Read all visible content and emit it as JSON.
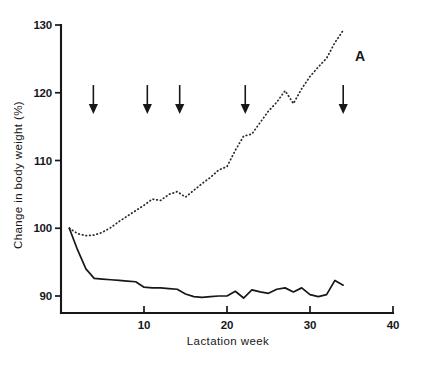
{
  "figure": {
    "panel_label": "A",
    "background_color": "#ffffff",
    "ink_color": "#17171a"
  },
  "chart_data": {
    "type": "line",
    "title": "",
    "subtitle": "",
    "xlabel": "Lactation week",
    "ylabel": "Change in body weight (%)",
    "xlim": [
      0,
      40
    ],
    "ylim": [
      86,
      130
    ],
    "xticks": [
      10,
      20,
      30,
      40
    ],
    "xtick_labels": [
      "10",
      "20",
      "30",
      "40"
    ],
    "yticks": [
      90,
      100,
      110,
      120,
      130
    ],
    "ytick_labels": [
      "90",
      "100",
      "110",
      "120",
      "130"
    ],
    "grid": false,
    "legend": false,
    "legend_position": "none",
    "annotations": [
      {
        "text": "A",
        "x": 36.8,
        "y": 125.0,
        "role": "panel-label"
      }
    ],
    "markers": {
      "type": "down-arrow",
      "label": "treatment-marker",
      "y": 117.0,
      "x_values": [
        3.9,
        10.4,
        14.3,
        22.2,
        34.0
      ]
    },
    "series": [
      {
        "name": "dotted",
        "style": "dotted",
        "color": "#2a2a2e",
        "x": [
          1,
          2,
          3,
          4,
          5,
          6,
          7,
          8,
          9,
          10,
          11,
          12,
          13,
          14,
          15,
          16,
          17,
          18,
          19,
          20,
          21,
          22,
          23,
          24,
          25,
          26,
          27,
          28,
          29,
          30,
          31,
          32,
          33,
          34
        ],
        "values": [
          100.0,
          99.2,
          98.9,
          99.0,
          99.4,
          100.1,
          101.0,
          101.8,
          102.6,
          103.4,
          104.3,
          104.1,
          105.0,
          105.4,
          104.6,
          105.6,
          106.6,
          107.5,
          108.6,
          109.1,
          111.5,
          113.6,
          113.9,
          115.6,
          117.3,
          118.6,
          120.3,
          118.4,
          120.6,
          122.4,
          123.8,
          125.1,
          127.4,
          129.2
        ]
      },
      {
        "name": "solid",
        "style": "solid",
        "color": "#17171a",
        "x": [
          1,
          2,
          3,
          4,
          5,
          6,
          7,
          8,
          9,
          10,
          11,
          12,
          13,
          14,
          15,
          16,
          17,
          18,
          19,
          20,
          21,
          22,
          23,
          24,
          25,
          26,
          27,
          28,
          29,
          30,
          31,
          32,
          33,
          34
        ],
        "values": [
          100.0,
          96.8,
          94.0,
          92.6,
          92.5,
          92.4,
          92.3,
          92.2,
          92.1,
          91.3,
          91.2,
          91.2,
          91.1,
          91.0,
          90.3,
          89.9,
          89.8,
          89.9,
          90.0,
          90.0,
          90.7,
          89.7,
          90.9,
          90.6,
          90.4,
          91.0,
          91.2,
          90.6,
          91.2,
          90.2,
          89.9,
          90.2,
          92.3,
          91.6
        ]
      }
    ]
  }
}
